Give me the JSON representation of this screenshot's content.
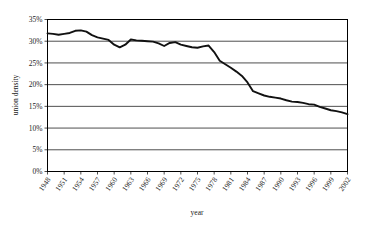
{
  "chart_data": {
    "type": "line",
    "title": "",
    "xlabel": "year",
    "ylabel": "union density",
    "xlim": [
      1948,
      2002
    ],
    "ylim": [
      0,
      35
    ],
    "grid": true,
    "legend": false,
    "y_tick_labels": [
      "0%",
      "5%",
      "10%",
      "15%",
      "20%",
      "25%",
      "30%",
      "35%"
    ],
    "y_tick_values": [
      0,
      5,
      10,
      15,
      20,
      25,
      30,
      35
    ],
    "x_tick_labels": [
      "1948",
      "1951",
      "1954",
      "1957",
      "1960",
      "1963",
      "1966",
      "1969",
      "1972",
      "1975",
      "1978",
      "1981",
      "1984",
      "1987",
      "1990",
      "1993",
      "1996",
      "1999",
      "2002"
    ],
    "x_tick_values": [
      1948,
      1951,
      1954,
      1957,
      1960,
      1963,
      1966,
      1969,
      1972,
      1975,
      1978,
      1981,
      1984,
      1987,
      1990,
      1993,
      1996,
      1999,
      2002
    ],
    "series": [
      {
        "name": "union density",
        "color": "#111111",
        "x": [
          1948,
          1949,
          1950,
          1951,
          1952,
          1953,
          1954,
          1955,
          1956,
          1957,
          1958,
          1959,
          1960,
          1961,
          1962,
          1963,
          1964,
          1965,
          1966,
          1967,
          1968,
          1969,
          1970,
          1971,
          1972,
          1973,
          1974,
          1975,
          1976,
          1977,
          1978,
          1979,
          1980,
          1981,
          1982,
          1983,
          1984,
          1985,
          1986,
          1987,
          1988,
          1989,
          1990,
          1991,
          1992,
          1993,
          1994,
          1995,
          1996,
          1997,
          1998,
          1999,
          2000,
          2001,
          2002
        ],
        "values": [
          31.8,
          31.7,
          31.5,
          31.7,
          31.9,
          32.4,
          32.5,
          32.2,
          31.4,
          30.9,
          30.6,
          30.3,
          29.2,
          28.6,
          29.2,
          30.4,
          30.2,
          30.1,
          30.0,
          29.9,
          29.5,
          28.9,
          29.6,
          29.8,
          29.2,
          28.9,
          28.6,
          28.5,
          28.8,
          29.0,
          27.5,
          25.5,
          24.7,
          23.9,
          23.0,
          22.0,
          20.5,
          18.5,
          18.0,
          17.5,
          17.2,
          17.0,
          16.8,
          16.4,
          16.1,
          16.0,
          15.8,
          15.5,
          15.4,
          14.9,
          14.5,
          14.1,
          13.9,
          13.6,
          13.2
        ]
      }
    ]
  }
}
